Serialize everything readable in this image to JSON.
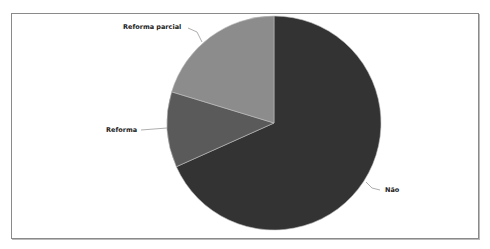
{
  "chart_data": {
    "type": "pie",
    "title": "",
    "categories": [
      "Não",
      "Reforma",
      "Reforma parcial"
    ],
    "values": [
      68.3,
      11.4,
      20.3
    ],
    "unit": "%",
    "colors": [
      "#333333",
      "#5a5a5a",
      "#8c8c8c"
    ],
    "start_angle_deg": 0,
    "direction": "clockwise",
    "legend": "none",
    "labels_position": "outside-with-leader-lines"
  },
  "labels": {
    "nao": "Não",
    "reforma": "Reforma",
    "reforma_parcial": "Reforma parcial"
  }
}
